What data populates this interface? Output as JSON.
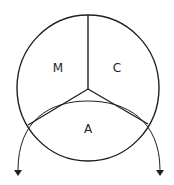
{
  "diagram": {
    "regions": [
      {
        "id": "M",
        "label": "M"
      },
      {
        "id": "C",
        "label": "C"
      },
      {
        "id": "A",
        "label": "A"
      }
    ],
    "colors": {
      "stroke": "#231f20",
      "background": "#ffffff"
    },
    "arrows": [
      {
        "name": "left-down-arrow",
        "direction": "down"
      },
      {
        "name": "right-down-arrow",
        "direction": "down"
      }
    ]
  }
}
